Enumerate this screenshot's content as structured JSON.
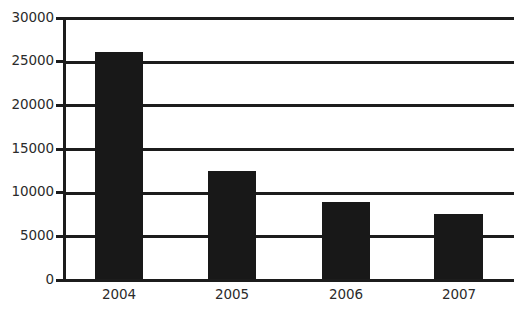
{
  "chart_data": {
    "type": "bar",
    "title": "",
    "subtitle": "",
    "xlabel": "",
    "ylabel": "",
    "categories": [
      "2004",
      "2005",
      "2006",
      "2007"
    ],
    "values": [
      26000,
      12400,
      8800,
      7400
    ],
    "series": [
      {
        "name": "",
        "values": [
          26000,
          12400,
          8800,
          7400
        ]
      }
    ],
    "ylim": [
      0,
      30000
    ],
    "ytick_labels": [
      "0",
      "5000",
      "10000",
      "15000",
      "20000",
      "25000",
      "30000"
    ],
    "ytick_values": [
      0,
      5000,
      10000,
      15000,
      20000,
      25000,
      30000
    ],
    "grid": true,
    "grid_axis": "y",
    "legend": false,
    "legend_position": "none",
    "bar_color": "#181818",
    "axis_color": "#1c1c1c",
    "text_color": "#2b2b2b",
    "background_color": "#ffffff"
  }
}
